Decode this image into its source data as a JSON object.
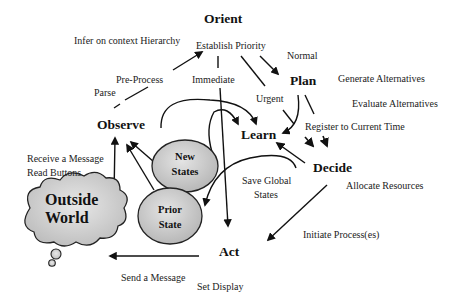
{
  "diagram": {
    "type": "OODA loop flow diagram",
    "nodes": {
      "orient": "Orient",
      "observe": "Observe",
      "plan": "Plan",
      "learn": "Learn",
      "decide": "Decide",
      "act": "Act"
    },
    "states": {
      "new_states": [
        "New",
        "States"
      ],
      "prior_state": [
        "Prior",
        "State"
      ]
    },
    "cloud": {
      "line1": "Outside",
      "line2": "World"
    },
    "labels": {
      "infer_context": "Infer on context Hierarchy",
      "establish_priority": "Establish Priority",
      "normal": "Normal",
      "pre_process": "Pre-Process",
      "parse": "Parse",
      "immediate": "Immediate",
      "urgent": "Urgent",
      "generate_alternatives": "Generate Alternatives",
      "evaluate_alternatives": "Evaluate Alternatives",
      "register_time": "Register to Current Time",
      "receive_message": "Receive a Message",
      "read_buttons": "Read Buttons",
      "save_global_1": "Save Global",
      "save_global_2": "States",
      "allocate_resources": "Allocate Resources",
      "initiate_process": "Initiate Process(es)",
      "send_message": "Send a Message",
      "set_display": "Set Display"
    },
    "colors": {
      "ellipse_fill": "#c8c8c8",
      "stroke": "#1a1a1a",
      "background": "#ffffff"
    }
  }
}
